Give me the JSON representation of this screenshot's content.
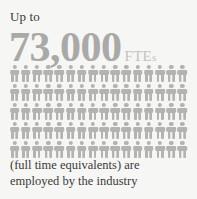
{
  "infographic": {
    "background_color": "#f6f6f5",
    "kicker": "Up to",
    "value": "73,000",
    "unit": "FTE",
    "unit_suffix": "s",
    "value_color": "#a9a9a7",
    "unit_color": "#c2c2bf",
    "figure_color": "#b3b3b0",
    "text_color": "#3a3a38",
    "caption_line1": "(full time equivalents) are",
    "caption_line2": "employed by the industry"
  },
  "chart_data": {
    "type": "pictogram",
    "title": "Up to 73,000 FTEs",
    "value": 73000,
    "unit": "FTEs",
    "icon": "person-icon",
    "rows": 5,
    "columns": 16,
    "total_icons": 80,
    "icon_color": "#b3b3b0",
    "annotations": [
      "Up to",
      "73,000",
      "FTEs",
      "(full time equivalents) are",
      "employed by the industry"
    ],
    "legend": [],
    "grid": false
  }
}
